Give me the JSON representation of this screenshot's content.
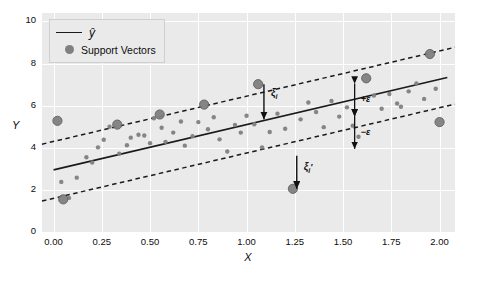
{
  "chart_data": {
    "type": "scatter",
    "title": "",
    "xlabel": "X",
    "ylabel": "Y",
    "xlim": [
      -0.06,
      2.08
    ],
    "ylim": [
      0,
      10.4
    ],
    "xticks": [
      "0.00",
      "0.25",
      "0.50",
      "0.75",
      "1.00",
      "1.25",
      "1.50",
      "1.75",
      "2.00"
    ],
    "xtick_values": [
      0.0,
      0.25,
      0.5,
      0.75,
      1.0,
      1.25,
      1.5,
      1.75,
      2.0
    ],
    "yticks": [
      "0",
      "2",
      "4",
      "6",
      "8",
      "10"
    ],
    "ytick_values": [
      0,
      2,
      4,
      6,
      8,
      10
    ],
    "grid": true,
    "legend_position": "upper left",
    "legend": [
      {
        "label": "ŷ",
        "marker": "line",
        "color": "#1a1a1a"
      },
      {
        "label": "Support Vectors",
        "marker": "circle",
        "color": "#808080"
      }
    ],
    "fit_line": {
      "name": "y-hat",
      "intercept": 2.95,
      "slope": 2.15,
      "color": "#1a1a1a",
      "style": "solid"
    },
    "epsilon": 1.35,
    "tube_upper": {
      "name": "y-hat + epsilon",
      "style": "dashed",
      "color": "#1a1a1a"
    },
    "tube_lower": {
      "name": "y-hat - epsilon",
      "style": "dashed",
      "color": "#1a1a1a"
    },
    "series": [
      {
        "name": "data points",
        "color": "#808080",
        "points": [
          [
            0.04,
            2.38
          ],
          [
            0.05,
            1.55
          ],
          [
            0.02,
            5.28
          ],
          [
            0.08,
            1.62
          ],
          [
            0.12,
            2.58
          ],
          [
            0.17,
            3.55
          ],
          [
            0.2,
            3.3
          ],
          [
            0.23,
            4.02
          ],
          [
            0.26,
            4.38
          ],
          [
            0.29,
            5.0
          ],
          [
            0.33,
            5.1
          ],
          [
            0.34,
            3.72
          ],
          [
            0.38,
            4.12
          ],
          [
            0.4,
            4.48
          ],
          [
            0.44,
            4.62
          ],
          [
            0.47,
            4.58
          ],
          [
            0.5,
            4.22
          ],
          [
            0.52,
            5.4
          ],
          [
            0.55,
            5.58
          ],
          [
            0.56,
            4.95
          ],
          [
            0.58,
            4.28
          ],
          [
            0.62,
            4.72
          ],
          [
            0.66,
            5.25
          ],
          [
            0.68,
            4.1
          ],
          [
            0.72,
            4.55
          ],
          [
            0.75,
            5.22
          ],
          [
            0.78,
            6.05
          ],
          [
            0.8,
            4.88
          ],
          [
            0.83,
            5.45
          ],
          [
            0.86,
            4.4
          ],
          [
            0.9,
            3.82
          ],
          [
            0.94,
            5.08
          ],
          [
            0.97,
            4.72
          ],
          [
            1.0,
            5.52
          ],
          [
            1.04,
            5.12
          ],
          [
            1.06,
            7.02
          ],
          [
            1.08,
            4.02
          ],
          [
            1.12,
            4.75
          ],
          [
            1.16,
            5.62
          ],
          [
            1.2,
            4.9
          ],
          [
            1.24,
            2.05
          ],
          [
            1.28,
            5.35
          ],
          [
            1.32,
            6.15
          ],
          [
            1.36,
            5.7
          ],
          [
            1.4,
            4.98
          ],
          [
            1.44,
            6.22
          ],
          [
            1.48,
            5.48
          ],
          [
            1.52,
            5.92
          ],
          [
            1.55,
            5.05
          ],
          [
            1.58,
            4.52
          ],
          [
            1.62,
            7.3
          ],
          [
            1.66,
            6.48
          ],
          [
            1.7,
            5.85
          ],
          [
            1.74,
            6.55
          ],
          [
            1.78,
            6.1
          ],
          [
            1.8,
            5.95
          ],
          [
            1.84,
            6.68
          ],
          [
            1.88,
            7.05
          ],
          [
            1.92,
            6.32
          ],
          [
            1.95,
            8.45
          ],
          [
            1.98,
            6.8
          ],
          [
            2.0,
            5.22
          ]
        ]
      },
      {
        "name": "Support Vectors",
        "color": "#808080",
        "points": [
          [
            0.02,
            5.28
          ],
          [
            0.05,
            1.55
          ],
          [
            0.33,
            5.1
          ],
          [
            0.55,
            5.58
          ],
          [
            0.78,
            6.05
          ],
          [
            1.06,
            7.02
          ],
          [
            1.24,
            2.05
          ],
          [
            1.62,
            7.3
          ],
          [
            1.95,
            8.45
          ],
          [
            2.0,
            5.22
          ]
        ]
      }
    ],
    "annotations": [
      {
        "name": "slack-upper",
        "label": "ξ",
        "sub": "i",
        "prime": false,
        "x": 1.09,
        "y_text": 6.55,
        "arrow_from_y": 7.02,
        "arrow_to_y": 5.35
      },
      {
        "name": "slack-lower",
        "label": "ξ",
        "sub": "i",
        "prime": true,
        "x": 1.26,
        "y_text": 3.05,
        "arrow_from_y": 3.62,
        "arrow_to_y": 2.05
      },
      {
        "name": "eps-plus",
        "label": "+ε",
        "x": 1.56,
        "y_top": 7.05,
        "y_mid": 5.5
      },
      {
        "name": "eps-minus",
        "label": "−ε",
        "x": 1.56,
        "y_mid": 5.5,
        "y_bot": 3.95
      }
    ]
  }
}
